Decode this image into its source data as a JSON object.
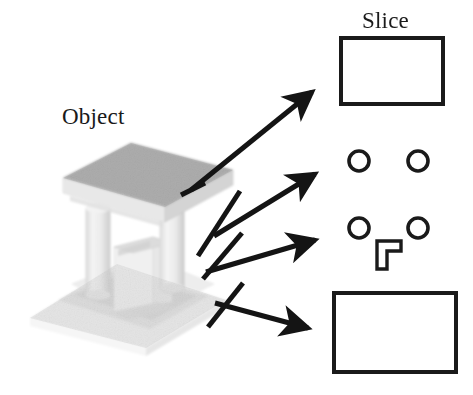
{
  "figure": {
    "background_color": "#ffffff",
    "stroke_color": "#1a1a1a",
    "width": 473,
    "height": 395
  },
  "labels": {
    "object": "Object",
    "slice": "Slice"
  },
  "object_model": {
    "description": "Gray-shaded 3D rendering of a machine part: a flat top plate supported by two cylindrical pillars standing on a flat base plate, with an L-shaped block between the pillars.",
    "colors": {
      "top_plate_top_face": "#b9b9b9",
      "top_plate_front_face": "#e4e4e4",
      "top_plate_side_face": "#d2d2d2",
      "base_plate_top_face": "#e8e8e8",
      "base_plate_front_face": "#f2f2f2",
      "pillar_body": "#ededed",
      "pillar_shadow": "#dcdcdc",
      "l_block_face": "#efefef",
      "l_block_top": "#e0e0e0",
      "contact_shadow": "#cfcfcf"
    },
    "parts": [
      {
        "name": "top-plate",
        "kind": "slab"
      },
      {
        "name": "pillar-left",
        "kind": "cylinder"
      },
      {
        "name": "pillar-right",
        "kind": "cylinder"
      },
      {
        "name": "l-block",
        "kind": "extruded-L"
      },
      {
        "name": "base-plate",
        "kind": "slab"
      }
    ]
  },
  "arrows": [
    {
      "id": "arrow-1",
      "from_part": "top-plate",
      "to_slice": "slice-1-rectangle",
      "has_tick": true,
      "direction": "up-right"
    },
    {
      "id": "arrow-2",
      "from_part": "pillars-only",
      "to_slice": "slice-2-two-circles",
      "has_tick": true,
      "direction": "up-right"
    },
    {
      "id": "arrow-3",
      "from_part": "pillars-and-l-block",
      "to_slice": "slice-3-circles-and-L",
      "has_tick": true,
      "direction": "right"
    },
    {
      "id": "arrow-4",
      "from_part": "base-plate",
      "to_slice": "slice-4-rectangle",
      "has_tick": true,
      "direction": "down-right"
    }
  ],
  "slices": [
    {
      "id": "slice-1-rectangle",
      "kind": "rectangle",
      "x": 341,
      "y": 38,
      "width": 102,
      "height": 66,
      "stroke": "#1a1a1a",
      "stroke_width": 4,
      "fill": "#ffffff"
    },
    {
      "id": "slice-2-two-circles",
      "kind": "circles",
      "circles": [
        {
          "cx": 359,
          "cy": 161,
          "r": 10
        },
        {
          "cx": 418,
          "cy": 161,
          "r": 10
        }
      ],
      "stroke": "#1a1a1a",
      "stroke_width": 3.5,
      "fill": "#ffffff"
    },
    {
      "id": "slice-3-circles-and-L",
      "kind": "circles-and-L",
      "circles": [
        {
          "cx": 359,
          "cy": 228,
          "r": 10
        },
        {
          "cx": 418,
          "cy": 228,
          "r": 10
        }
      ],
      "l_shape": {
        "x": 377,
        "y": 239,
        "arm_width": 24,
        "stem_height": 30,
        "thickness": 10
      },
      "stroke": "#1a1a1a",
      "stroke_width": 3.5,
      "fill": "#ffffff"
    },
    {
      "id": "slice-4-rectangle",
      "kind": "rectangle",
      "x": 334,
      "y": 293,
      "width": 122,
      "height": 79,
      "stroke": "#1a1a1a",
      "stroke_width": 4,
      "fill": "#ffffff"
    }
  ]
}
